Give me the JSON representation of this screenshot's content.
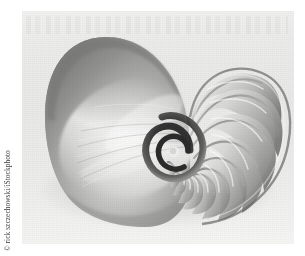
{
  "figure": {
    "rendering": "grayscale photograph",
    "background_color": "#ffffff",
    "plate_color": "#ececeb"
  },
  "credit": {
    "text": "© rick szczechowski/iStockphoto",
    "orientation": "vertical-rotated-90-ccw",
    "color": "#3d3d3d"
  },
  "photo": {
    "alt": "Cross-section of a chambered nautilus shell showing a logarithmic spiral of septa",
    "left": 22,
    "top": 11,
    "width": 272,
    "height": 233
  },
  "shell": {
    "spiral_center_x": 168,
    "spiral_center_y": 139,
    "chamber_count": 17,
    "tones": {
      "deep_shadow": "#4c4c4c",
      "mid_gray": "#9a9a9a",
      "light_gray": "#c9c9c9",
      "highlight": "#f0f0ee",
      "core_black": "#232323"
    }
  }
}
